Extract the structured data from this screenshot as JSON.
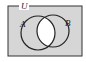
{
  "diagram": {
    "type": "venn",
    "universe_label": "U",
    "sets": [
      {
        "label": "A"
      },
      {
        "label": "B"
      }
    ],
    "shaded_region": "U minus (A ∩ B)",
    "colors": {
      "shade": "#d6d6d6",
      "unshaded": "#ffffff",
      "stroke": "#222222"
    }
  }
}
